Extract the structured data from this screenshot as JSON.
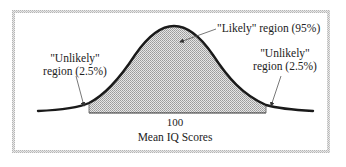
{
  "diagram": {
    "type": "normal-distribution",
    "labels": {
      "likely": "\"Likely\" region (95%)",
      "unlikely_left_line1": "\"Unlikely\"",
      "unlikely_left_line2": "region (2.5%)",
      "unlikely_right_line1": "\"Unlikely\"",
      "unlikely_right_line2": "region (2.5%)",
      "mean_tick": "100",
      "axis_label": "Mean IQ Scores"
    },
    "regions": [
      {
        "name": "Unlikely left",
        "percent": 2.5
      },
      {
        "name": "Likely",
        "percent": 95
      },
      {
        "name": "Unlikely right",
        "percent": 2.5
      }
    ],
    "colors": {
      "curve": "#1a1a1a",
      "shade": "#c8c8c8",
      "frame": "#cfcfcf",
      "arrow": "#555555"
    }
  }
}
